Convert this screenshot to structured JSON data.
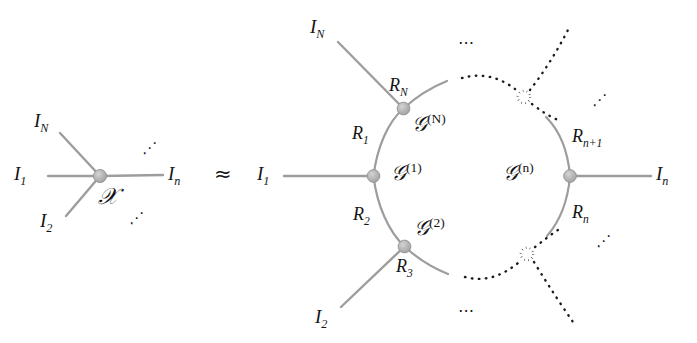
{
  "figure": {
    "type": "tensor-network-diagram",
    "relation_symbol": "≈",
    "line_color": "#9a9a9a",
    "node_color": "#b0b0b0",
    "text_color": "#141414",
    "background": "#ffffff"
  },
  "left": {
    "center_label": "𝒳",
    "legs": [
      {
        "id": "I_N",
        "base": "I",
        "sub": "N"
      },
      {
        "id": "I_1",
        "base": "I",
        "sub": "1"
      },
      {
        "id": "I_2",
        "base": "I",
        "sub": "2"
      },
      {
        "id": "I_n",
        "base": "I",
        "sub": "n"
      }
    ],
    "ellipses": [
      {
        "id": "upper-right-dots",
        "glyph": "⋰"
      },
      {
        "id": "lower-right-dots",
        "glyph": "⋰"
      }
    ]
  },
  "right": {
    "cores": [
      {
        "id": "G_N",
        "base": "𝒢",
        "sup": "(N)"
      },
      {
        "id": "G_1",
        "base": "𝒢",
        "sup": "(1)"
      },
      {
        "id": "G_2",
        "base": "𝒢",
        "sup": "(2)"
      },
      {
        "id": "G_n",
        "base": "𝒢",
        "sup": "(n)"
      }
    ],
    "ranks": [
      {
        "id": "R_N",
        "base": "R",
        "sub": "N"
      },
      {
        "id": "R_1",
        "base": "R",
        "sub": "1"
      },
      {
        "id": "R_2",
        "base": "R",
        "sub": "2"
      },
      {
        "id": "R_3",
        "base": "R",
        "sub": "3"
      },
      {
        "id": "R_n1",
        "base": "R",
        "sub": "n+1"
      },
      {
        "id": "R_n",
        "base": "R",
        "sub": "n"
      }
    ],
    "legs": [
      {
        "id": "I_N",
        "base": "I",
        "sub": "N"
      },
      {
        "id": "I_1",
        "base": "I",
        "sub": "1"
      },
      {
        "id": "I_2",
        "base": "I",
        "sub": "2"
      },
      {
        "id": "I_n",
        "base": "I",
        "sub": "n"
      }
    ],
    "placeholder_nodes": [
      {
        "id": "upper-hollow-node",
        "style": "dotted-open"
      },
      {
        "id": "lower-hollow-node",
        "style": "dotted-open"
      }
    ],
    "ellipses": [
      {
        "id": "top-dots",
        "glyph": "⋯"
      },
      {
        "id": "right-upper-dots",
        "glyph": "⋰"
      },
      {
        "id": "right-lower-dots",
        "glyph": "⋰"
      },
      {
        "id": "bottom-dots",
        "glyph": "⋯"
      }
    ]
  },
  "labels": {
    "left_center": "𝒳",
    "left_I_N": "I",
    "left_I_N_sub": "N",
    "left_I_1": "I",
    "left_I_1_sub": "1",
    "left_I_2": "I",
    "left_I_2_sub": "2",
    "left_I_n": "I",
    "left_I_n_sub": "n",
    "left_dots_up": "⋰",
    "left_dots_down": "⋰",
    "approx": "≈",
    "right_I_N": "I",
    "right_I_N_sub": "N",
    "right_I_1": "I",
    "right_I_1_sub": "1",
    "right_I_2": "I",
    "right_I_2_sub": "2",
    "right_I_n": "I",
    "right_I_n_sub": "n",
    "R_N": "R",
    "R_N_sub": "N",
    "R_1": "R",
    "R_1_sub": "1",
    "R_2": "R",
    "R_2_sub": "2",
    "R_3": "R",
    "R_3_sub": "3",
    "R_n1": "R",
    "R_n1_sub": "n+1",
    "R_n": "R",
    "R_n_sub": "n",
    "G_base": "𝒢",
    "G_N_sup": "(N)",
    "G_1_sup": "(1)",
    "G_2_sup": "(2)",
    "G_n_sup": "(n)",
    "dots_top": "⋯",
    "dots_right_up": "⋰",
    "dots_right_low": "⋰",
    "dots_bottom": "⋯"
  }
}
